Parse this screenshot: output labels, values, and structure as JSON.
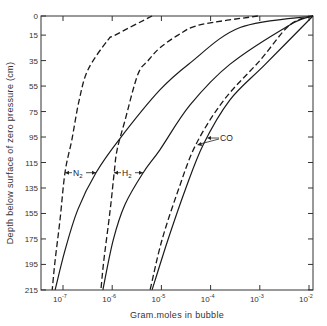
{
  "chart_data": {
    "type": "line",
    "title": "",
    "xlabel": "Gram.moles in bubble",
    "ylabel": "Depth below surface of zero pressure (cm)",
    "xscale": "log",
    "xlim": [
      5e-08,
      0.012
    ],
    "ylim": [
      215,
      0
    ],
    "y_inverted": true,
    "grid": false,
    "legend": "inline annotations",
    "x_ticks": [
      {
        "value": 1e-07,
        "label": "10",
        "exp": "-7"
      },
      {
        "value": 1e-06,
        "label": "10",
        "exp": "-6"
      },
      {
        "value": 1e-05,
        "label": "10",
        "exp": "-5"
      },
      {
        "value": 0.0001,
        "label": "10",
        "exp": "-4"
      },
      {
        "value": 0.001,
        "label": "10",
        "exp": "-3"
      },
      {
        "value": 0.01,
        "label": "10",
        "exp": "-2"
      }
    ],
    "y_ticks": [
      0,
      15,
      35,
      55,
      75,
      95,
      115,
      135,
      155,
      175,
      195,
      215
    ],
    "annotations": [
      {
        "text": "N",
        "sub": "2",
        "depth": 123,
        "between_series": [
          "N2 dashed",
          "N2 solid"
        ]
      },
      {
        "text": "H",
        "sub": "2",
        "depth": 123,
        "between_series": [
          "H2 dashed",
          "H2 solid"
        ]
      },
      {
        "text": "CO",
        "depth": 97,
        "points_to": [
          "CO dashed",
          "CO solid"
        ]
      }
    ],
    "series": [
      {
        "name": "N2 dashed",
        "style": "dashed",
        "depth": [
          0,
          15,
          19,
          42,
          66,
          97,
          123,
          160,
          192,
          215
        ],
        "log10_moles": [
          -5.19,
          -5.94,
          -6.09,
          -6.49,
          -6.67,
          -6.82,
          -6.96,
          -7.06,
          -7.16,
          -7.22
        ]
      },
      {
        "name": "N2 solid",
        "style": "solid",
        "depth": [
          0,
          9,
          37,
          58,
          96,
          123,
          152,
          184,
          215
        ],
        "log10_moles": [
          -1.92,
          -3.4,
          -4.42,
          -5.03,
          -5.84,
          -6.33,
          -6.7,
          -6.96,
          -7.16
        ]
      },
      {
        "name": "H2 dashed",
        "style": "dashed",
        "depth": [
          0,
          7,
          15,
          25,
          35,
          46,
          82,
          105,
          123,
          152,
          192,
          215
        ],
        "log10_moles": [
          -3.04,
          -4.22,
          -4.66,
          -5.03,
          -5.27,
          -5.48,
          -5.74,
          -5.9,
          -5.96,
          -6.04,
          -6.17,
          -6.23
        ]
      },
      {
        "name": "H2 solid",
        "style": "solid",
        "depth": [
          0,
          7,
          38,
          70,
          105,
          123,
          148,
          176,
          215
        ],
        "log10_moles": [
          -1.92,
          -2.39,
          -3.61,
          -4.42,
          -5.03,
          -5.37,
          -5.74,
          -5.98,
          -6.19
        ]
      },
      {
        "name": "CO dashed",
        "style": "dashed",
        "depth": [
          0,
          7,
          35,
          66,
          101,
          137,
          176,
          215
        ],
        "log10_moles": [
          -1.92,
          -2.39,
          -3.0,
          -3.73,
          -4.3,
          -4.66,
          -4.99,
          -5.23
        ]
      },
      {
        "name": "CO solid",
        "style": "solid",
        "depth": [
          0,
          38,
          66,
          101,
          137,
          176,
          215
        ],
        "log10_moles": [
          -1.92,
          -2.89,
          -3.61,
          -4.15,
          -4.52,
          -4.87,
          -5.19
        ]
      }
    ]
  },
  "layout": {
    "plot": {
      "left": 41,
      "top": 16,
      "right": 313,
      "bottom": 290
    },
    "x_origin_px": 63,
    "x_origin_log": -7,
    "px_per_decade": 49.2,
    "px_per_cm": 1.274
  }
}
